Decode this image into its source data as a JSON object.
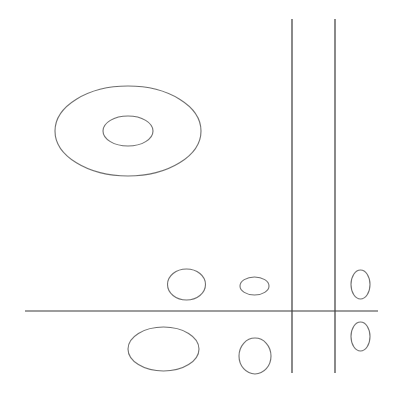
{
  "diagram": {
    "width": 393,
    "height": 397,
    "background": "#ffffff",
    "line_color": "#3a3a3a",
    "ellipse_color": "#6e6e6e",
    "lines": [
      {
        "id": "vertical-line-left",
        "x1": 292,
        "y1": 19,
        "x2": 292,
        "y2": 373
      },
      {
        "id": "vertical-line-right",
        "x1": 335,
        "y1": 19,
        "x2": 335,
        "y2": 373
      },
      {
        "id": "horizontal-line",
        "x1": 25,
        "y1": 311,
        "x2": 378,
        "y2": 311
      }
    ],
    "ellipses": [
      {
        "id": "large-outer-ellipse",
        "cx": 128,
        "cy": 131,
        "rx": 73,
        "ry": 45
      },
      {
        "id": "large-inner-ellipse",
        "cx": 128,
        "cy": 131,
        "rx": 25,
        "ry": 15
      },
      {
        "id": "upper-ellipse-1",
        "cx": 186.5,
        "cy": 284.5,
        "rx": 19,
        "ry": 15.5
      },
      {
        "id": "upper-ellipse-2",
        "cx": 254.5,
        "cy": 286,
        "rx": 14.5,
        "ry": 9
      },
      {
        "id": "upper-ellipse-3",
        "cx": 360.5,
        "cy": 284.5,
        "rx": 9.5,
        "ry": 14.5
      },
      {
        "id": "lower-ellipse-1",
        "cx": 163.5,
        "cy": 349,
        "rx": 35.5,
        "ry": 22
      },
      {
        "id": "lower-ellipse-2",
        "cx": 255,
        "cy": 356,
        "rx": 16,
        "ry": 18
      },
      {
        "id": "lower-ellipse-3",
        "cx": 360.5,
        "cy": 336.5,
        "rx": 9.5,
        "ry": 14.5
      }
    ]
  }
}
